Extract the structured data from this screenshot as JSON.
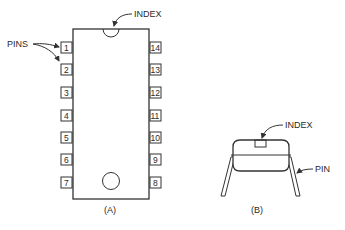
{
  "figure_a": {
    "caption": "(A)",
    "index_label": "INDEX",
    "pins_label": "PINS",
    "left_pins": [
      "1",
      "2",
      "3",
      "4",
      "5",
      "6",
      "7"
    ],
    "right_pins": [
      "14",
      "13",
      "12",
      "11",
      "10",
      "9",
      "8"
    ]
  },
  "figure_b": {
    "caption": "(B)",
    "index_label": "INDEX",
    "pin_label": "PIN"
  }
}
